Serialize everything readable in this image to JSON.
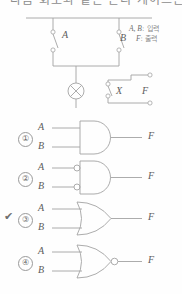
{
  "heading": {
    "text": "다음 회로와 같은 논리 게이트는?"
  },
  "legend": {
    "inputs_vars": "A, B",
    "inputs_desc": ": 입력",
    "output_var": "F",
    "output_desc": ": 출력"
  },
  "circuit": {
    "switch_a_label": "A",
    "switch_b_label": "B",
    "relay_label": "X",
    "output_label": "F",
    "lamp_name": "lamp-symbol"
  },
  "options": [
    {
      "number": "①",
      "gate": "AND",
      "input_a": "A",
      "input_b": "B",
      "output": "F",
      "selected": false,
      "check_mark": ""
    },
    {
      "number": "②",
      "gate": "AND-with-inverted-inputs",
      "input_a": "A",
      "input_b": "B",
      "output": "F",
      "selected": false,
      "check_mark": ""
    },
    {
      "number": "③",
      "gate": "OR",
      "input_a": "A",
      "input_b": "B",
      "output": "F",
      "selected": true,
      "check_mark": "✔"
    },
    {
      "number": "④",
      "gate": "NOR",
      "input_a": "A",
      "input_b": "B",
      "output": "F",
      "selected": false,
      "check_mark": ""
    }
  ],
  "colors": {
    "line": "#9a9a9a",
    "text": "#5c5c5c",
    "background": "#fefefe"
  }
}
